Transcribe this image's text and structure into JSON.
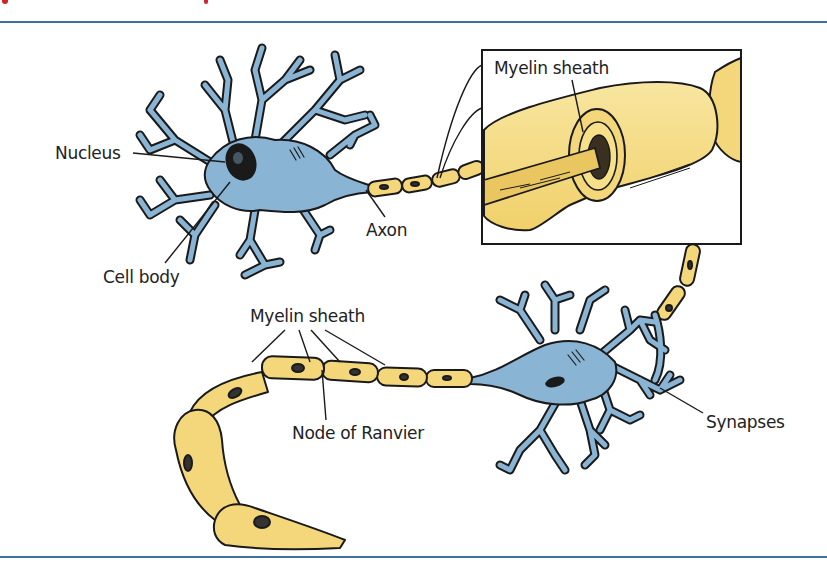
{
  "figure": {
    "title_fragment": "",
    "rule_color": "#3f6f9f",
    "colors": {
      "neuron_body": "#8ab4d4",
      "myelin": "#f3d77a",
      "myelin_light": "#f8e9a8",
      "outline": "#1a1a1a",
      "nucleus": "#1a1a1a",
      "label_text": "#222222",
      "title_red": "#d0232a"
    },
    "labels": {
      "nucleus": "Nucleus",
      "cell_body": "Cell body",
      "axon": "Axon",
      "myelin_sheath_inset": "Myelin sheath",
      "myelin_sheath_lower": "Myelin sheath",
      "node_of_ranvier": "Node of Ranvier",
      "synapses": "Synapses"
    },
    "inset": {
      "description": "magnified myelin sheath cross-section"
    }
  }
}
